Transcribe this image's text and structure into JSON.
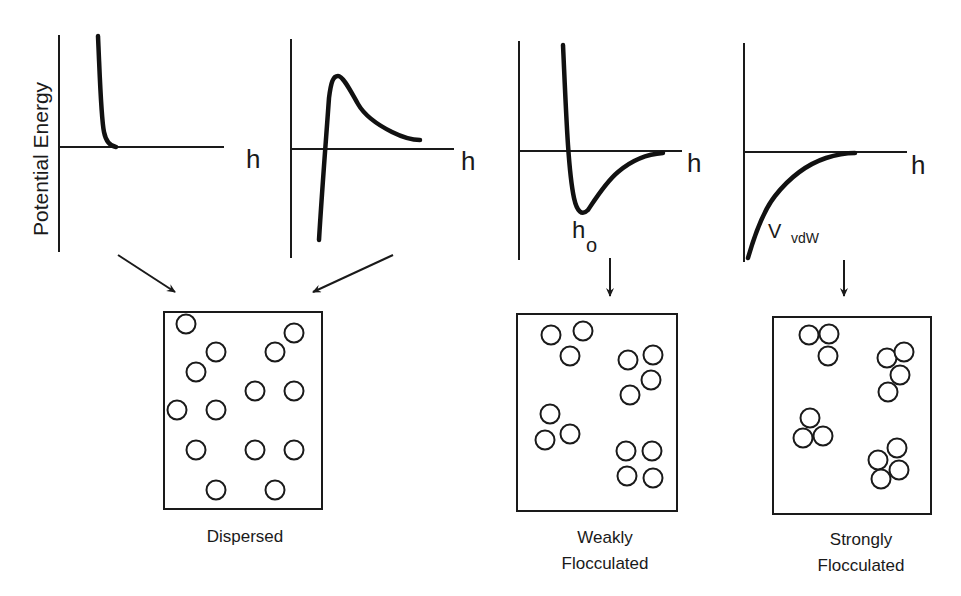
{
  "figure": {
    "ylabel": "Potential Energy",
    "xlabel": "h",
    "colors": {
      "ink": "#1a1a1a",
      "background": "#ffffff"
    }
  },
  "plots": [
    {
      "id": "steric-repulsion",
      "axis": {
        "x0": 59,
        "ytop": 35,
        "ybottom": 252,
        "xaxis_y": 147,
        "xend": 224
      },
      "h_label": {
        "text": "h",
        "x": 246,
        "y": 168
      },
      "curve": "M98,36 C100,80 101,118 104,132 C106,142 110,146 116,147"
    },
    {
      "id": "electrostatic-barrier",
      "axis": {
        "x0": 291,
        "ytop": 39,
        "ybottom": 258,
        "xaxis_y": 149,
        "xend": 454
      },
      "h_label": {
        "text": "h",
        "x": 461,
        "y": 170
      },
      "curve": "M319,240 C322,190 326,140 329,98 C331,82 333,76 338,76 C343,76 350,90 358,104 C366,118 380,126 392,132 C402,137 410,140 420,140"
    },
    {
      "id": "secondary-minimum",
      "axis": {
        "x0": 519,
        "ytop": 41,
        "ybottom": 260,
        "xaxis_y": 151,
        "xend": 682
      },
      "h_label": {
        "text": "h",
        "x": 687,
        "y": 172
      },
      "h0_label": {
        "text": "h",
        "sub": "o",
        "x": 572,
        "y": 238
      },
      "curve": "M563,45 C566,110 568,170 574,198 C577,212 582,216 588,210 C596,198 606,182 618,172 C632,160 648,154 663,153"
    },
    {
      "id": "van-der-waals",
      "axis": {
        "x0": 744,
        "ytop": 43,
        "ybottom": 262,
        "xaxis_y": 152,
        "xend": 907
      },
      "h_label": {
        "text": "h",
        "x": 911,
        "y": 174
      },
      "vdw_label": {
        "text": "V",
        "sub": "vdW",
        "x": 768,
        "y": 238
      },
      "curve": "M748,258 C756,230 764,210 775,196 C790,177 808,164 826,158 C838,154 848,153 855,153"
    }
  ],
  "arrows": [
    {
      "x1": 118,
      "y1": 255,
      "x2": 175,
      "y2": 292
    },
    {
      "x1": 393,
      "y1": 255,
      "x2": 313,
      "y2": 292
    },
    {
      "x1": 610,
      "y1": 258,
      "x2": 610,
      "y2": 296
    },
    {
      "x1": 844,
      "y1": 260,
      "x2": 844,
      "y2": 296
    }
  ],
  "panels": [
    {
      "id": "dispersed",
      "label_lines": [
        "Dispersed"
      ],
      "label_x": 245,
      "label_y": 542,
      "box": {
        "x": 164,
        "y": 312,
        "w": 158,
        "h": 197
      },
      "r": 9.5,
      "particles": [
        [
          186,
          324
        ],
        [
          216,
          352
        ],
        [
          196,
          372
        ],
        [
          177,
          410
        ],
        [
          216,
          410
        ],
        [
          196,
          450
        ],
        [
          216,
          490
        ],
        [
          275,
          352
        ],
        [
          294,
          333
        ],
        [
          255,
          391
        ],
        [
          294,
          391
        ],
        [
          255,
          450
        ],
        [
          294,
          450
        ],
        [
          275,
          490
        ]
      ]
    },
    {
      "id": "weakly-flocculated",
      "label_lines": [
        "Weakly",
        "Flocculated"
      ],
      "label_x": 605,
      "label_y": 543,
      "box": {
        "x": 517,
        "y": 314,
        "w": 160,
        "h": 197
      },
      "r": 9.5,
      "particles": [
        [
          551,
          335
        ],
        [
          583,
          331
        ],
        [
          570,
          356
        ],
        [
          628,
          360
        ],
        [
          653,
          355
        ],
        [
          651,
          380
        ],
        [
          630,
          395
        ],
        [
          550,
          414
        ],
        [
          545,
          440
        ],
        [
          570,
          434
        ],
        [
          626,
          451
        ],
        [
          652,
          451
        ],
        [
          627,
          476
        ],
        [
          653,
          478
        ]
      ]
    },
    {
      "id": "strongly-flocculated",
      "label_lines": [
        "Strongly",
        "Flocculated"
      ],
      "label_x": 861,
      "label_y": 545,
      "box": {
        "x": 773,
        "y": 317,
        "w": 158,
        "h": 197
      },
      "r": 9.5,
      "particles": [
        [
          809,
          335
        ],
        [
          829,
          334
        ],
        [
          828,
          356
        ],
        [
          887,
          358
        ],
        [
          904,
          352
        ],
        [
          900,
          375
        ],
        [
          888,
          392
        ],
        [
          810,
          418
        ],
        [
          803,
          438
        ],
        [
          823,
          436
        ],
        [
          897,
          448
        ],
        [
          878,
          460
        ],
        [
          899,
          470
        ],
        [
          881,
          479
        ]
      ]
    }
  ]
}
